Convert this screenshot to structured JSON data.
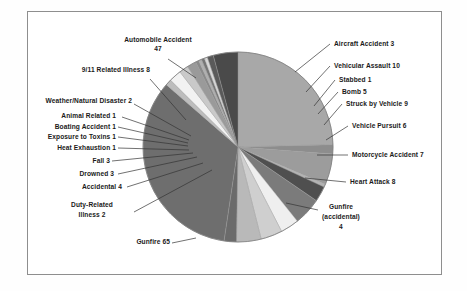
{
  "figure": {
    "kind": "pie-chart",
    "frame_border_color": "#8e8e8e",
    "background_color": "#ffffff",
    "text_color": "#1a1a1a"
  },
  "chart_data": {
    "type": "pie",
    "title": "",
    "xlabel": "",
    "ylabel": "",
    "total": 191,
    "legend_position": "callout-labels",
    "grid": false,
    "categories": [
      "Automobile Accident",
      "Aircraft Accident",
      "Vehicular Assault",
      "Stabbed",
      "Bomb",
      "Struck by Vehicle",
      "Vehicle Pursuit",
      "Motorcycle Accident",
      "Heart Attack",
      "Gunfire (accidental)",
      "Gunfire",
      "Duty-Related Illness",
      "Accidental",
      "Drowned",
      "Fall",
      "Heat Exhaustion",
      "Exposure to Toxins",
      "Boating Accident",
      "Animal Related",
      "Weather/Natural Disaster",
      "9/11 Related Illness"
    ],
    "values": [
      47,
      3,
      10,
      1,
      5,
      9,
      6,
      7,
      8,
      4,
      65,
      2,
      4,
      3,
      3,
      1,
      1,
      1,
      1,
      2,
      8
    ],
    "slice_colors": [
      "#a8a8a8",
      "#8d8d8d",
      "#9c9c9c",
      "#b4b4b4",
      "#4f4f4f",
      "#7b7b7b",
      "#efefef",
      "#cfcfcf",
      "#b9b9b9",
      "#6b6b6b",
      "#6e6e6e",
      "#bdbdbd",
      "#f2f2f2",
      "#c9c9c9",
      "#9a9a9a",
      "#8a8a8a",
      "#b0b0b0",
      "#767676",
      "#d8d8d8",
      "#5a5a5a",
      "#4a4a4a"
    ],
    "labels": [
      {
        "key": "automobile_accident",
        "text": "Automobile Accident",
        "value": "47"
      },
      {
        "key": "aircraft_accident",
        "text": "Aircraft Accident 3",
        "value": "3"
      },
      {
        "key": "vehicular_assault",
        "text": "Vehicular Assault 10",
        "value": "10"
      },
      {
        "key": "stabbed",
        "text": "Stabbed 1",
        "value": "1"
      },
      {
        "key": "bomb",
        "text": "Bomb 5",
        "value": "5"
      },
      {
        "key": "struck_by_vehicle",
        "text": "Struck by Vehicle 9",
        "value": "9"
      },
      {
        "key": "vehicle_pursuit",
        "text": "Vehicle Pursuit 6",
        "value": "6"
      },
      {
        "key": "motorcycle_accident",
        "text": "Motorcycle Accident 7",
        "value": "7"
      },
      {
        "key": "heart_attack",
        "text": "Heart Attack 8",
        "value": "8"
      },
      {
        "key": "gunfire_accidental_l1",
        "text": "Gunfire",
        "value": ""
      },
      {
        "key": "gunfire_accidental_l2",
        "text": "(accidental)",
        "value": ""
      },
      {
        "key": "gunfire_accidental_l3",
        "text": "4",
        "value": "4"
      },
      {
        "key": "gunfire",
        "text": "Gunfire 65",
        "value": "65"
      },
      {
        "key": "duty_related_l1",
        "text": "Duty-Related",
        "value": ""
      },
      {
        "key": "duty_related_l2",
        "text": "Illness 2",
        "value": "2"
      },
      {
        "key": "accidental",
        "text": "Accidental 4",
        "value": "4"
      },
      {
        "key": "drowned",
        "text": "Drowned 3",
        "value": "3"
      },
      {
        "key": "fall",
        "text": "Fall 3",
        "value": "3"
      },
      {
        "key": "heat_exhaustion",
        "text": "Heat Exhaustion 1",
        "value": "1"
      },
      {
        "key": "exposure_toxins",
        "text": "Exposure to Toxins 1",
        "value": "1"
      },
      {
        "key": "boating_accident",
        "text": "Boating Accident 1",
        "value": "1"
      },
      {
        "key": "animal_related",
        "text": "Animal Related 1",
        "value": "1"
      },
      {
        "key": "weather_disaster",
        "text": "Weather/Natural Disaster 2",
        "value": "2"
      },
      {
        "key": "related_illness_911",
        "text": "9/11 Related Illness 8",
        "value": "8"
      },
      {
        "key": "automobile_accident_value",
        "text": "47",
        "value": "47"
      }
    ]
  }
}
